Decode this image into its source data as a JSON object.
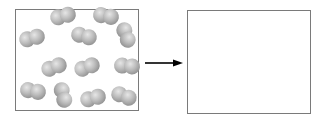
{
  "figure": {
    "type": "diatomic-molecules-reaction-diagram",
    "left_box": {
      "label": "",
      "molecule_count": 12,
      "molecules": [
        {
          "x": 63,
          "y": 16,
          "angle": -15
        },
        {
          "x": 106,
          "y": 16,
          "angle": 10
        },
        {
          "x": 32,
          "y": 38,
          "angle": -15
        },
        {
          "x": 84,
          "y": 36,
          "angle": 15
        },
        {
          "x": 126,
          "y": 35,
          "angle": 70
        },
        {
          "x": 54,
          "y": 67,
          "angle": -20
        },
        {
          "x": 87,
          "y": 67,
          "angle": -20
        },
        {
          "x": 127,
          "y": 66,
          "angle": 5
        },
        {
          "x": 33,
          "y": 91,
          "angle": 10
        },
        {
          "x": 63,
          "y": 95,
          "angle": 75
        },
        {
          "x": 93,
          "y": 98,
          "angle": -15
        },
        {
          "x": 124,
          "y": 96,
          "angle": 20
        }
      ]
    },
    "arrow": {
      "direction": "right"
    },
    "right_box": {
      "label": "",
      "contents": "empty"
    },
    "colors": {
      "border": "#7a7a7a",
      "atom": "#a0a0a0",
      "arrow": "#000000"
    }
  }
}
